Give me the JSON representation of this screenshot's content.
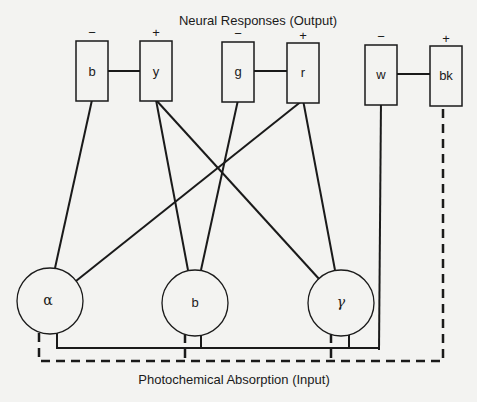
{
  "title": "Neural Responses (Output)",
  "footer": "Photochemical Absorption (Input)",
  "colors": {
    "background": "#f3f3f1",
    "ink": "#1a1a1a"
  },
  "output_units": [
    {
      "id": "b",
      "label": "b",
      "sign": "−",
      "pair": 1
    },
    {
      "id": "y",
      "label": "y",
      "sign": "+",
      "pair": 1
    },
    {
      "id": "g",
      "label": "g",
      "sign": "−",
      "pair": 2
    },
    {
      "id": "r",
      "label": "r",
      "sign": "+",
      "pair": 2
    },
    {
      "id": "w",
      "label": "w",
      "sign": "−",
      "pair": 3
    },
    {
      "id": "bk",
      "label": "bk",
      "sign": "+",
      "pair": 3
    }
  ],
  "receptors": [
    {
      "id": "alpha",
      "label": "α"
    },
    {
      "id": "beta",
      "label": "b"
    },
    {
      "id": "gamma",
      "label": "γ"
    }
  ],
  "connections": [
    {
      "from": "alpha",
      "to": "b",
      "style": "solid"
    },
    {
      "from": "alpha",
      "to": "r",
      "style": "solid"
    },
    {
      "from": "beta",
      "to": "y",
      "style": "solid"
    },
    {
      "from": "beta",
      "to": "g",
      "style": "solid"
    },
    {
      "from": "gamma",
      "to": "y",
      "style": "solid"
    },
    {
      "from": "gamma",
      "to": "r",
      "style": "solid"
    },
    {
      "from": "all_receptors",
      "to": "w",
      "style": "solid"
    },
    {
      "from": "all_receptors",
      "to": "bk",
      "style": "dashed"
    }
  ]
}
